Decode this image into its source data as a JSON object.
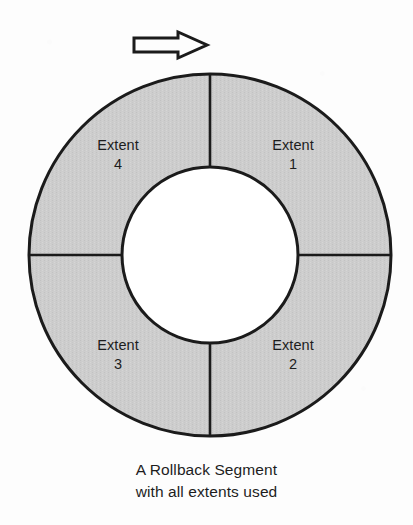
{
  "canvas": {
    "width": 413,
    "height": 525,
    "background_color": "#fdfdfd"
  },
  "colors": {
    "ring_fill": "#cdcdcd",
    "hub_fill": "#ffffff",
    "outline": "#1b1b1b",
    "text": "#1d1d1d",
    "arrow_fill": "#fdfdfd"
  },
  "arrow": {
    "icon": "right-block-arrow-icon",
    "direction": "right",
    "meaning": "write direction"
  },
  "diagram": {
    "center_x": 210,
    "center_y": 255,
    "outer_radius": 181,
    "inner_radius": 88,
    "segment_count": 4,
    "segments": [
      {
        "id": "extent-1",
        "name": "Extent",
        "number": "1",
        "quadrant": "upper-right",
        "start_angle_deg": 0,
        "end_angle_deg": 90
      },
      {
        "id": "extent-2",
        "name": "Extent",
        "number": "2",
        "quadrant": "lower-right",
        "start_angle_deg": 90,
        "end_angle_deg": 180
      },
      {
        "id": "extent-3",
        "name": "Extent",
        "number": "3",
        "quadrant": "lower-left",
        "start_angle_deg": 180,
        "end_angle_deg": 270
      },
      {
        "id": "extent-4",
        "name": "Extent",
        "number": "4",
        "quadrant": "upper-left",
        "start_angle_deg": 270,
        "end_angle_deg": 360
      }
    ]
  },
  "caption": {
    "line1": "A Rollback Segment",
    "line2": "with all extents used"
  }
}
